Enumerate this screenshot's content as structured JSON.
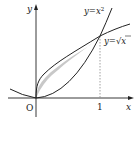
{
  "diagram": {
    "title": "",
    "axes": {
      "x_label": "x",
      "y_label": "y",
      "origin_label": "O",
      "tick_x": "1"
    },
    "curves": [
      {
        "name": "parabola",
        "label": "y=x²",
        "label_base": "y=x",
        "label_sup": "2"
      },
      {
        "name": "sqrt",
        "label": "y=√x",
        "label_base": "y=",
        "label_rad": "x"
      }
    ],
    "shaded_region": {
      "description": "area between y=x² and y=√x for 0≤x≤1",
      "fill": "#c8c8c8"
    },
    "colors": {
      "stroke": "#222222",
      "fill": "#c8c8c8",
      "dashed": "#888888"
    }
  }
}
